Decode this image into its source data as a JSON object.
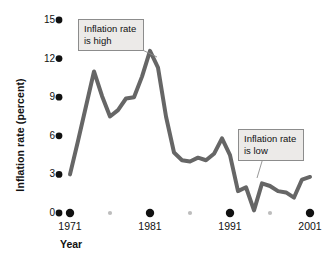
{
  "chart_data": {
    "type": "line",
    "title": "",
    "xlabel": "Year",
    "ylabel": "Inflation rate (percent)",
    "xlim": [
      1971,
      2001
    ],
    "ylim": [
      0,
      15
    ],
    "yticks": [
      0,
      3,
      6,
      9,
      12,
      15
    ],
    "ytick_labels": [
      "0",
      "3",
      "6",
      "9",
      "12",
      "15"
    ],
    "xticks": [
      1971,
      1981,
      1991,
      2001
    ],
    "xtick_labels": [
      "1971",
      "1981",
      "1991",
      "2001"
    ],
    "minor_xticks": [
      1976,
      1986,
      1996
    ],
    "grid": false,
    "legend": false,
    "series": [
      {
        "name": "Inflation rate",
        "color": "#666666",
        "x": [
          1971,
          1972,
          1973,
          1974,
          1975,
          1976,
          1977,
          1978,
          1979,
          1980,
          1981,
          1982,
          1983,
          1984,
          1985,
          1986,
          1987,
          1988,
          1989,
          1990,
          1991,
          1992,
          1993,
          1994,
          1995,
          1996,
          1997,
          1998,
          1999,
          2000,
          2001
        ],
        "values": [
          3.0,
          5.6,
          8.3,
          11.0,
          9.1,
          7.5,
          8.0,
          8.9,
          9.0,
          10.6,
          12.6,
          11.3,
          7.5,
          4.7,
          4.1,
          4.0,
          4.3,
          4.1,
          4.6,
          5.8,
          4.5,
          1.7,
          2.0,
          0.2,
          2.3,
          2.1,
          1.7,
          1.6,
          1.2,
          2.6,
          2.8
        ],
        "linewidth": 4
      }
    ],
    "annotations": [
      {
        "name": "inflation-high",
        "text": "Inflation rate\nis high",
        "points_to_year": 1981,
        "points_to_value": 12.6
      },
      {
        "name": "inflation-low",
        "text": "Inflation rate\nis low",
        "points_to_year": 1994,
        "points_to_value": 2.0
      }
    ]
  },
  "axes": {
    "ytick_labels": [
      "15",
      "12",
      "9",
      "6",
      "3",
      "0"
    ],
    "xtick_labels": [
      "1971",
      "1981",
      "1991",
      "2001"
    ],
    "xaxis_title": "Year",
    "yaxis_title": "Inflation rate (percent)"
  },
  "callouts": {
    "high": "Inflation rate\nis high",
    "low": "Inflation rate\nis low"
  },
  "colors": {
    "line": "#666666",
    "tick_dot": "#111111",
    "minor_dot": "#bdbdbd",
    "callout_bg": "#eceae8",
    "callout_border": "#8c8c8c",
    "leader_line": "#8c8c8c"
  }
}
